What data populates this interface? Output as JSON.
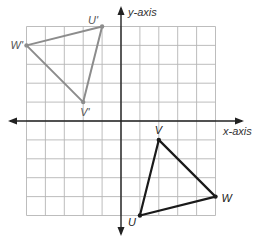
{
  "diagram": {
    "type": "coordinate-plane-transformation",
    "grid": {
      "xmin": -5,
      "xmax": 5,
      "ymin": -5,
      "ymax": 5,
      "step": 1
    },
    "axes": {
      "x_label": "x-axis",
      "y_label": "y-axis"
    },
    "colors": {
      "grid": "#b5b5b5",
      "axis": "#222222",
      "original": "#1a1a1a",
      "image": "#8c8c8c"
    },
    "triangles": [
      {
        "name": "UVW",
        "role": "original",
        "vertices": [
          {
            "label": "U",
            "x": 1,
            "y": -5
          },
          {
            "label": "V",
            "x": 2,
            "y": -1
          },
          {
            "label": "W",
            "x": 5,
            "y": -4
          }
        ]
      },
      {
        "name": "U'V'W'",
        "role": "image",
        "vertices": [
          {
            "label": "U'",
            "x": -1,
            "y": 5
          },
          {
            "label": "V'",
            "x": -2,
            "y": 1
          },
          {
            "label": "W'",
            "x": -5,
            "y": 4
          }
        ]
      }
    ]
  }
}
